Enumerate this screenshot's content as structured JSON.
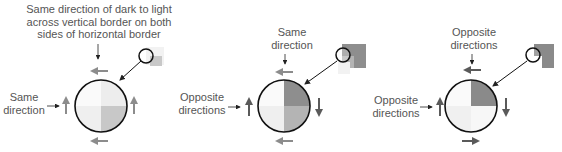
{
  "panels": [
    {
      "top_caption": [
        "Same direction of dark to light",
        "across vertical border on both",
        "sides of horizontal border"
      ],
      "side_caption": [
        "Same",
        "direction"
      ],
      "quadrants": {
        "tl": "#fafafa",
        "tr": "#ededed",
        "bl": "#efefef",
        "br": "#c8c8c8"
      }
    },
    {
      "top_caption": [
        "Same",
        "direction"
      ],
      "side_caption": [
        "Opposite",
        "directions"
      ],
      "quadrants": {
        "tl": "#fafafa",
        "tr": "#8e8e8e",
        "bl": "#efefef",
        "br": "#b4b4b4"
      }
    },
    {
      "top_caption": [
        "Opposite",
        "directions"
      ],
      "side_caption": [
        "Opposite",
        "directions"
      ],
      "quadrants": {
        "tl": "#fafafa",
        "tr": "#8a8a8a",
        "bl": "#f0f0f0",
        "br": "#f7f7f7"
      }
    }
  ],
  "colors": {
    "arrow_gray": "#8c8c8c",
    "arrow_dark": "#5a5a5a",
    "outline": "#111111"
  }
}
